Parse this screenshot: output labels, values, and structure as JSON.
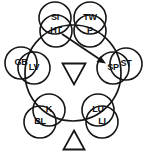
{
  "diagram": {
    "type": "circular-node-diagram",
    "stroke_color": "#161616",
    "background_color": "#ffffff",
    "ring": {
      "cx": 73,
      "cy": 73,
      "r": 48
    },
    "nodes": [
      {
        "id": "node-si",
        "label": "SI",
        "cx": 55,
        "cy": 18,
        "r": 16
      },
      {
        "id": "node-tw",
        "label": "TW",
        "cx": 90,
        "cy": 18,
        "r": 16
      },
      {
        "id": "node-ht",
        "label": "HT",
        "cx": 56,
        "cy": 31,
        "r": 16
      },
      {
        "id": "node-p",
        "label": "P",
        "cx": 90,
        "cy": 31,
        "r": 16
      },
      {
        "id": "node-gb",
        "label": "GB",
        "cx": 21,
        "cy": 63,
        "r": 16
      },
      {
        "id": "node-lv",
        "label": "LV",
        "cx": 34,
        "cy": 68,
        "r": 16
      },
      {
        "id": "node-sp",
        "label": "SP",
        "cx": 113,
        "cy": 68,
        "r": 16
      },
      {
        "id": "node-st",
        "label": "ST",
        "cx": 126,
        "cy": 64,
        "r": 16
      },
      {
        "id": "node-k",
        "label": "K",
        "cx": 49,
        "cy": 110,
        "r": 16
      },
      {
        "id": "node-bl",
        "label": "BL",
        "cx": 40,
        "cy": 122,
        "r": 16
      },
      {
        "id": "node-lu",
        "label": "LU",
        "cx": 98,
        "cy": 110,
        "r": 16
      },
      {
        "id": "node-li",
        "label": "LI",
        "cx": 102,
        "cy": 122,
        "r": 16
      }
    ],
    "arrow": {
      "name": "ht-to-sp-arrow",
      "from": "HT",
      "to": "SP",
      "x1": 62,
      "y1": 34,
      "x2": 104,
      "y2": 62
    },
    "triangles": [
      {
        "name": "yin-triangle-down",
        "direction": "down",
        "cx": 74,
        "cy": 74,
        "width": 23,
        "height": 21
      },
      {
        "name": "yang-triangle-up",
        "direction": "up",
        "cx": 74,
        "cy": 140,
        "width": 21,
        "height": 19
      }
    ]
  }
}
